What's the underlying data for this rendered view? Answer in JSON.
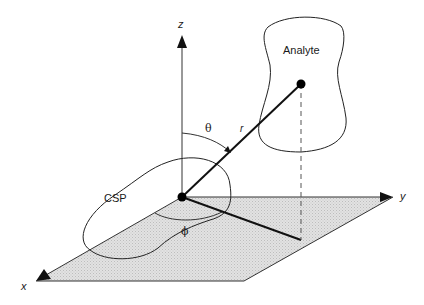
{
  "diagram": {
    "type": "3d-coordinate-geometry",
    "colors": {
      "line": "#1a1a1a",
      "plane_fill": "#d9d9d9",
      "background": "#ffffff"
    },
    "axes": {
      "x": "x",
      "y": "y",
      "z": "z"
    },
    "labels": {
      "analyte": "Analyte",
      "csp": "CSP",
      "theta": "θ",
      "phi": "ϕ",
      "r": "r"
    }
  }
}
